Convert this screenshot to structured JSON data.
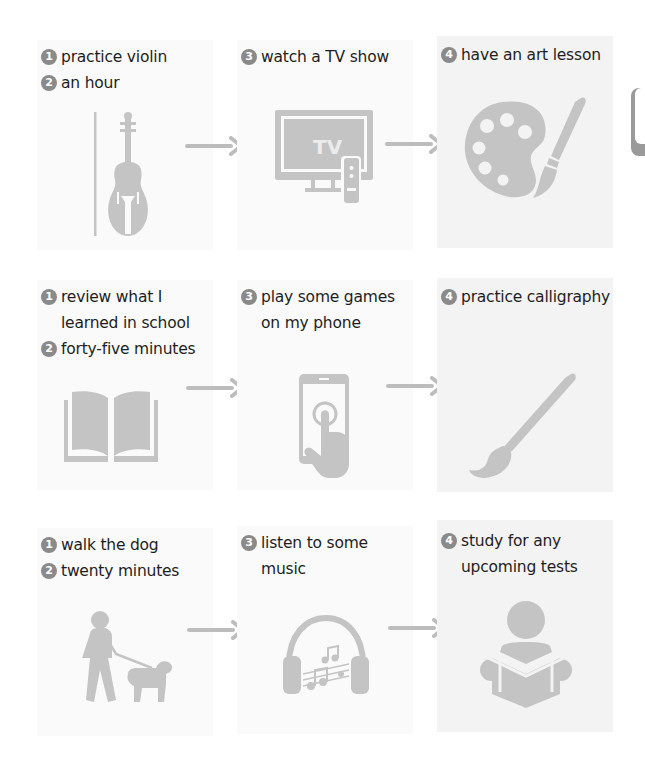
{
  "colors": {
    "icon": "#c4c4c4",
    "text": "#1e1e1e",
    "badge": "#8a8a8a",
    "panel": "#fafafa",
    "panel_alt": "#f3f3f3",
    "arrow": "#bdbdbd"
  },
  "rows": [
    {
      "col1": {
        "lines": [
          {
            "badge": "1",
            "text": "practice violin"
          },
          {
            "badge": "2",
            "text": "an hour"
          }
        ],
        "icon": "violin-icon"
      },
      "col2": {
        "lines": [
          {
            "badge": "3",
            "text": "watch a TV show"
          }
        ],
        "icon": "tv-icon",
        "icon_text": "TV"
      },
      "col3": {
        "lines": [
          {
            "badge": "4",
            "text": "have an art lesson"
          }
        ],
        "icon": "palette-brush-icon"
      }
    },
    {
      "col1": {
        "lines": [
          {
            "badge": "1",
            "text": "review what I"
          },
          {
            "badge": "",
            "text": "learned in school"
          },
          {
            "badge": "2",
            "text": "forty-five minutes"
          }
        ],
        "icon": "open-book-icon"
      },
      "col2": {
        "lines": [
          {
            "badge": "3",
            "text": "play some games"
          },
          {
            "badge": "",
            "text": "on my phone"
          }
        ],
        "icon": "phone-tap-icon"
      },
      "col3": {
        "lines": [
          {
            "badge": "4",
            "text": "practice calligraphy"
          }
        ],
        "icon": "brush-icon"
      }
    },
    {
      "col1": {
        "lines": [
          {
            "badge": "1",
            "text": "walk the dog"
          },
          {
            "badge": "2",
            "text": "twenty minutes"
          }
        ],
        "icon": "dog-walker-icon"
      },
      "col2": {
        "lines": [
          {
            "badge": "3",
            "text": "listen to some"
          },
          {
            "badge": "",
            "text": "music"
          }
        ],
        "icon": "headphones-music-icon"
      },
      "col3": {
        "lines": [
          {
            "badge": "4",
            "text": "study for any"
          },
          {
            "badge": "",
            "text": "upcoming tests"
          }
        ],
        "icon": "reading-person-icon"
      }
    }
  ],
  "arrows": [
    "arrow-right-icon"
  ]
}
